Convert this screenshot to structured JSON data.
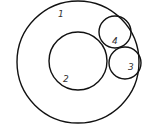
{
  "diagram": {
    "type": "nested-circles",
    "stroke_color": "#111111",
    "background": "#ffffff",
    "circles": [
      {
        "id": "1",
        "label": "1",
        "cx": 78,
        "cy": 62,
        "r": 61,
        "label_x": 58,
        "label_y": 17
      },
      {
        "id": "2",
        "label": "2",
        "cx": 78,
        "cy": 61,
        "r": 29,
        "label_x": 63,
        "label_y": 82
      },
      {
        "id": "4",
        "label": "4",
        "cx": 115,
        "cy": 32,
        "r": 16,
        "label_x": 112,
        "label_y": 44
      },
      {
        "id": "3",
        "label": "3",
        "cx": 125,
        "cy": 63,
        "r": 16,
        "label_x": 128,
        "label_y": 70
      }
    ]
  }
}
